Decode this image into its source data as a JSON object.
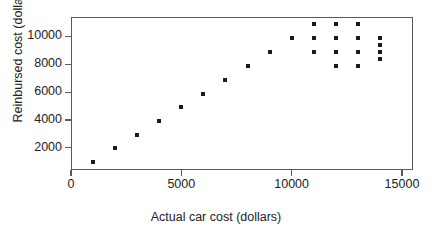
{
  "chart_data": {
    "type": "scatter",
    "title": "",
    "xlabel": "Actual car cost (dollars)",
    "ylabel": "Reinbursed cost (dollars)",
    "xlim": [
      0,
      15500
    ],
    "ylim": [
      400,
      11400
    ],
    "xticks": [
      0,
      5000,
      10000,
      15000
    ],
    "xtick_labels": [
      "0",
      "5000",
      "10000",
      "15000"
    ],
    "yticks": [
      2000,
      4000,
      6000,
      8000,
      10000
    ],
    "ytick_labels": [
      "2000",
      "4000",
      "6000",
      "8000",
      "10000"
    ],
    "grid": false,
    "legend": null,
    "marker": "square",
    "marker_color": "#1a1a1a",
    "frame_color": "#5a5a5a",
    "points": [
      {
        "x": 1000,
        "y": 1000
      },
      {
        "x": 2000,
        "y": 1950
      },
      {
        "x": 3000,
        "y": 2950
      },
      {
        "x": 4000,
        "y": 3950
      },
      {
        "x": 5000,
        "y": 4900
      },
      {
        "x": 6000,
        "y": 5900
      },
      {
        "x": 7000,
        "y": 6900
      },
      {
        "x": 8000,
        "y": 7900
      },
      {
        "x": 9000,
        "y": 8900
      },
      {
        "x": 10000,
        "y": 9900
      },
      {
        "x": 11000,
        "y": 10900
      },
      {
        "x": 11000,
        "y": 9900
      },
      {
        "x": 11000,
        "y": 8900
      },
      {
        "x": 12000,
        "y": 10900
      },
      {
        "x": 12000,
        "y": 9900
      },
      {
        "x": 12000,
        "y": 8900
      },
      {
        "x": 12000,
        "y": 7900
      },
      {
        "x": 13000,
        "y": 10900
      },
      {
        "x": 13000,
        "y": 9900
      },
      {
        "x": 13000,
        "y": 8900
      },
      {
        "x": 13000,
        "y": 7900
      },
      {
        "x": 14000,
        "y": 9900
      },
      {
        "x": 14000,
        "y": 9400
      },
      {
        "x": 14000,
        "y": 8900
      },
      {
        "x": 14000,
        "y": 8350
      }
    ]
  }
}
